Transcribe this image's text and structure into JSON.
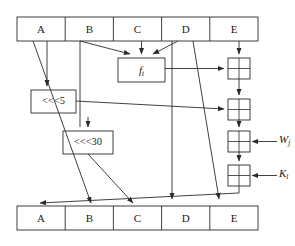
{
  "diagram": {
    "colors": {
      "stroke": "#2b2b2b",
      "fill": "#ffffff",
      "background": "#ffffff"
    },
    "top_register": {
      "name": "top-register-bar",
      "cells": [
        {
          "label": "A"
        },
        {
          "label": "B"
        },
        {
          "label": "C"
        },
        {
          "label": "D"
        },
        {
          "label": "E"
        }
      ]
    },
    "bottom_register": {
      "name": "bottom-register-bar",
      "cells": [
        {
          "label": "A"
        },
        {
          "label": "B"
        },
        {
          "label": "C"
        },
        {
          "label": "D"
        },
        {
          "label": "E"
        }
      ]
    },
    "operations": {
      "function_box": {
        "label": "f",
        "subscript": "t"
      },
      "rotate_left_5": {
        "label": "<<<5"
      },
      "rotate_left_30": {
        "label": "<<<30"
      }
    },
    "xor_nodes": [
      {
        "name": "xor-1",
        "operator": "xor"
      },
      {
        "name": "xor-2",
        "operator": "xor"
      },
      {
        "name": "xor-3",
        "operator": "xor"
      },
      {
        "name": "xor-4",
        "operator": "xor"
      }
    ],
    "inputs": [
      {
        "name": "word-input",
        "label": "W",
        "subscript": "j"
      },
      {
        "name": "constant-input",
        "label": "K",
        "subscript": "t"
      }
    ]
  }
}
